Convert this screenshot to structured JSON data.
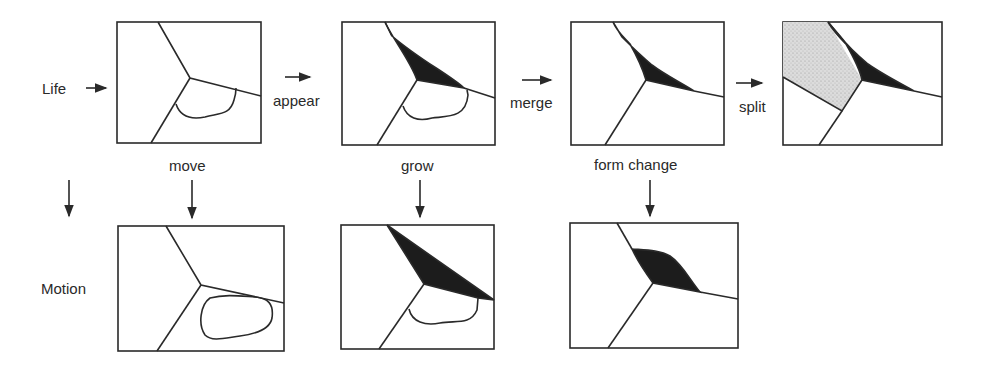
{
  "labels": {
    "row_top": "Life",
    "row_bottom": "Motion",
    "appear": "appear",
    "merge": "merge",
    "split": "split",
    "move": "move",
    "grow": "grow",
    "form_change": "form change"
  },
  "panels": [
    {
      "id": "life-initial",
      "row": "Life",
      "description": "three regions meeting at a junction with a small blob"
    },
    {
      "id": "life-appear",
      "row": "Life",
      "description": "black region appears along upper boundary"
    },
    {
      "id": "life-merge",
      "row": "Life",
      "description": "blob merged; black region remains"
    },
    {
      "id": "life-split",
      "row": "Life",
      "description": "grey stippled region split off at left"
    },
    {
      "id": "motion-move",
      "row": "Motion",
      "description": "blob moved"
    },
    {
      "id": "motion-grow",
      "row": "Motion",
      "description": "black region grown"
    },
    {
      "id": "motion-form-change",
      "row": "Motion",
      "description": "black region changed form"
    }
  ],
  "colors": {
    "stroke": "#2a2a2a",
    "fill_dark": "#1c1c1c",
    "fill_grey": "#d6d6d6",
    "background": "#ffffff"
  }
}
